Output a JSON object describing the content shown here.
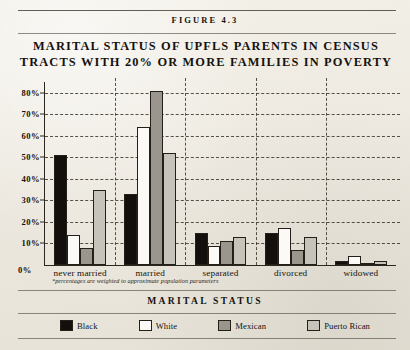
{
  "figure_header": "FIGURE 4.3",
  "title_lines": [
    "MARITAL STATUS OF UPFLS PARENTS IN CENSUS",
    "TRACTS WITH 20% OR MORE FAMILIES IN POVERTY"
  ],
  "zero_label": "0%",
  "footnote": "*percentages are weighted to approximate population parameters",
  "axis_title": "MARITAL STATUS",
  "legend": [
    {
      "label": "Black",
      "color": "#120f0c",
      "key": "black"
    },
    {
      "label": "White",
      "color": "#fbfaf6",
      "key": "white"
    },
    {
      "label": "Mexican",
      "color": "#9a968d",
      "key": "mexican"
    },
    {
      "label": "Puerto Rican",
      "color": "#c6c3ba",
      "key": "puerto"
    }
  ],
  "chart_data": {
    "type": "bar",
    "title": "MARITAL STATUS OF UPFLS PARENTS IN CENSUS TRACTS WITH 20% OR MORE FAMILIES IN POVERTY",
    "xlabel": "MARITAL STATUS",
    "ylabel": "",
    "ylim": [
      0,
      85
    ],
    "ytick_labels": [
      "80%",
      "70%",
      "60%",
      "50%",
      "40%",
      "30%",
      "20%",
      "10%",
      "0%"
    ],
    "ytick_values": [
      80,
      70,
      60,
      50,
      40,
      30,
      20,
      10,
      0
    ],
    "grid": "horizontal-dashed-and-group-separators",
    "legend_position": "bottom",
    "categories": [
      "never married",
      "married",
      "separated",
      "divorced",
      "widowed"
    ],
    "series": [
      {
        "name": "Black",
        "values": [
          51,
          33,
          15,
          15,
          2
        ]
      },
      {
        "name": "White",
        "values": [
          14,
          64,
          9,
          17,
          4
        ]
      },
      {
        "name": "Mexican",
        "values": [
          8,
          81,
          11,
          7,
          1
        ]
      },
      {
        "name": "Puerto Rican",
        "values": [
          35,
          52,
          13,
          13,
          2
        ]
      }
    ],
    "note": "*percentages are weighted to approximate population parameters"
  }
}
